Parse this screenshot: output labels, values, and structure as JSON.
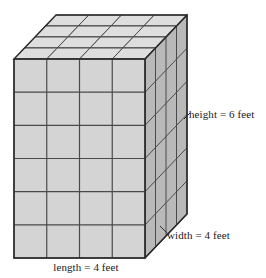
{
  "figure": {
    "name": "rectangular-prism-of-unit-cubes",
    "type": "3d-solid-diagram",
    "projection": "oblique-cavalier",
    "background_color": "#ffffff"
  },
  "solid": {
    "shape": "rectangular prism",
    "unit": "feet",
    "length_cubes": 4,
    "width_cubes": 4,
    "height_cubes": 6,
    "total_unit_cubes": 96,
    "faces": {
      "front": {
        "name": "front-face",
        "columns": 4,
        "rows": 6,
        "fill": "#d4d4d4",
        "stroke": "#3c3c3c"
      },
      "right": {
        "name": "right-side-face",
        "columns": 4,
        "rows": 6,
        "fill": "#b9b9b9",
        "stroke": "#3c3c3c"
      },
      "top": {
        "name": "top-face",
        "columns": 4,
        "rows": 4,
        "fill": "#dedede",
        "stroke": "#3c3c3c"
      }
    }
  },
  "labels": {
    "height": "height = 6 feet",
    "width": "width = 4 feet",
    "length": "length = 4 feet"
  },
  "colors": {
    "outline": "#2b2b2b",
    "gridline": "#4a4a4a",
    "front_fill": "#d4d4d4",
    "right_fill": "#b9b9b9",
    "top_fill": "#dedede",
    "text": "#1a1a1a",
    "page_background": "#ffffff"
  },
  "geometry": {
    "front_left_x": 14,
    "front_right_x": 145,
    "front_top_y": 59,
    "front_bottom_y": 258,
    "depth_dx": 10.5,
    "depth_dy": -11.0,
    "cell_w": 32.75,
    "cell_h": 33.17
  }
}
